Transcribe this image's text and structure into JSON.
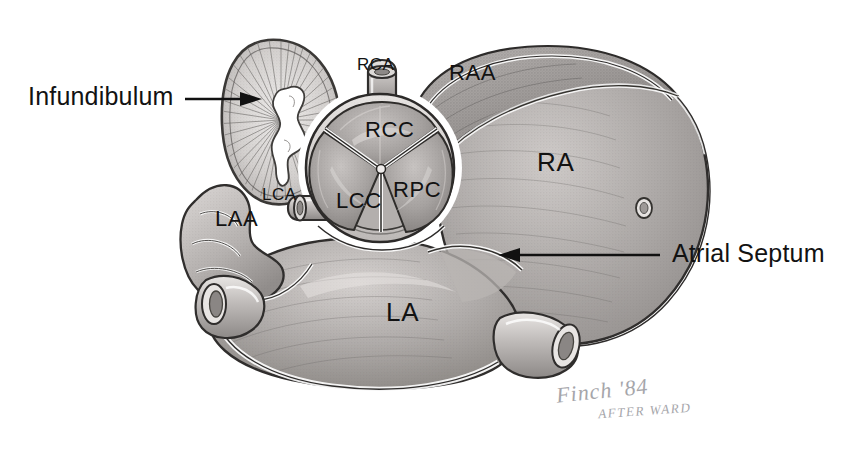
{
  "figure": {
    "background_color": "#ffffff",
    "ink_color": "#121212",
    "tissue_light": "#d8d5d3",
    "tissue_mid": "#a9a5a4",
    "tissue_dark": "#7d7a79",
    "width": 864,
    "height": 449
  },
  "callouts": [
    {
      "id": "infundibulum",
      "label": "Infundibulum",
      "arrow": "points-right"
    },
    {
      "id": "atrial-septum",
      "label": "Atrial Septum",
      "arrow": "points-left"
    }
  ],
  "anatomy_labels": [
    {
      "id": "rca",
      "label": "RCA",
      "meaning": "right coronary artery"
    },
    {
      "id": "raa",
      "label": "RAA",
      "meaning": "right atrial appendage"
    },
    {
      "id": "rcc",
      "label": "RCC",
      "meaning": "right coronary cusp"
    },
    {
      "id": "rpc",
      "label": "RPC",
      "meaning": "right posterior cusp"
    },
    {
      "id": "lcc",
      "label": "LCC",
      "meaning": "left coronary cusp"
    },
    {
      "id": "lca",
      "label": "LCA",
      "meaning": "left coronary artery"
    },
    {
      "id": "laa",
      "label": "LAA",
      "meaning": "left atrial appendage"
    },
    {
      "id": "ra",
      "label": "RA",
      "meaning": "right atrium"
    },
    {
      "id": "la",
      "label": "LA",
      "meaning": "left atrium"
    }
  ],
  "signature": {
    "artist_line": "Finch '84",
    "credit_line": "AFTER WARD"
  }
}
